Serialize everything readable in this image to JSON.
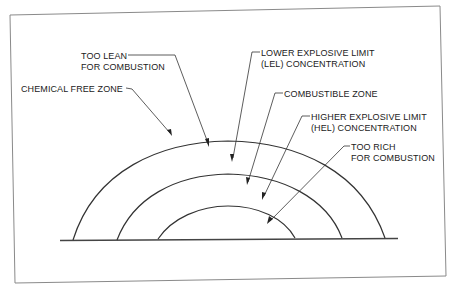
{
  "diagram": {
    "zones": [
      {
        "id": "chemical-free",
        "label_lines": [
          "CHEMICAL FREE ZONE"
        ]
      },
      {
        "id": "too-lean",
        "label_lines": [
          "TOO LEAN",
          "FOR COMBUSTION"
        ]
      },
      {
        "id": "lel",
        "label_lines": [
          "LOWER EXPLOSIVE LIMIT",
          "(LEL) CONCENTRATION"
        ]
      },
      {
        "id": "combustible",
        "label_lines": [
          "COMBUSTIBLE ZONE"
        ]
      },
      {
        "id": "hel",
        "label_lines": [
          "HIGHER EXPLOSIVE LIMIT",
          "(HEL) CONCENTRATION"
        ]
      },
      {
        "id": "too-rich",
        "label_lines": [
          "TOO RICH",
          "FOR COMBUSTION"
        ]
      }
    ],
    "arcs": [
      "outer-boundary",
      "lel-boundary",
      "hel-boundary"
    ],
    "colors": {
      "line": "#333333",
      "frame": "#8a8a8a",
      "text": "#222222",
      "background": "#ffffff"
    }
  }
}
